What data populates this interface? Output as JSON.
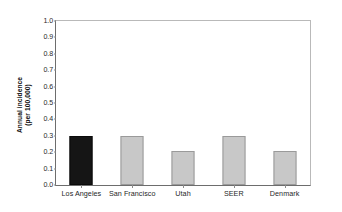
{
  "chart_data": {
    "type": "bar",
    "title": "",
    "xlabel": "",
    "ylabel": "Annual incidence (per 100,000)",
    "ylabel_lines": [
      "Annual incidence",
      "(per 100,000)"
    ],
    "categories": [
      "Los Angeles",
      "San Francisco",
      "Utah",
      "SEER",
      "Denmark"
    ],
    "values": [
      0.3,
      0.3,
      0.21,
      0.3,
      0.21
    ],
    "bar_colors": [
      "#151515",
      "#c8c8c8",
      "#c8c8c8",
      "#c8c8c8",
      "#c8c8c8"
    ],
    "highlight_category": "Los Angeles",
    "ylim": [
      0.0,
      1.0
    ],
    "ytick_values": [
      0.0,
      0.1,
      0.2,
      0.3,
      0.4,
      0.5,
      0.6,
      0.7,
      0.8,
      0.9,
      1.0
    ],
    "ytick_labels": [
      "0.0",
      "0.1",
      "0.2",
      "0.3",
      "0.4",
      "0.5",
      "0.6",
      "0.7",
      "0.8",
      "0.9",
      "1.0"
    ],
    "grid": false,
    "legend": null,
    "annotations": []
  },
  "axis": {
    "y_title_line1": "Annual incidence",
    "y_title_line2": "(per 100,000)"
  },
  "colors": {
    "bar_gray_fill": "#c8c8c8",
    "bar_gray_stroke": "#9a9a9a",
    "bar_dark_fill": "#151515",
    "axis_line": "#6d6d6d",
    "frame_line": "#b9b9b9",
    "background": "#ffffff",
    "text": "#1a1a1a"
  }
}
